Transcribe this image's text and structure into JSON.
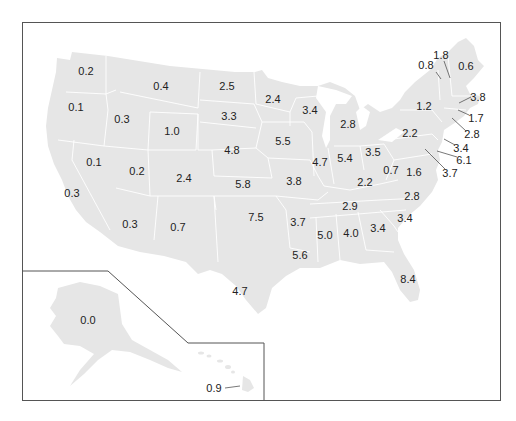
{
  "map": {
    "type": "choropleth-labeled",
    "region": "United States",
    "fill_color": "#e6e6e6",
    "border_color": "#ffffff",
    "frame_color": "#555555",
    "labels": [
      {
        "state": "WA",
        "value": "0.2",
        "x": 86,
        "y": 71
      },
      {
        "state": "OR",
        "value": "0.1",
        "x": 76,
        "y": 107
      },
      {
        "state": "ID",
        "value": "0.3",
        "x": 122,
        "y": 119
      },
      {
        "state": "MT",
        "value": "0.4",
        "x": 161,
        "y": 86
      },
      {
        "state": "WY",
        "value": "1.0",
        "x": 172,
        "y": 131
      },
      {
        "state": "ND",
        "value": "2.5",
        "x": 227,
        "y": 86
      },
      {
        "state": "SD",
        "value": "3.3",
        "x": 229,
        "y": 116
      },
      {
        "state": "NE",
        "value": "4.8",
        "x": 232,
        "y": 150
      },
      {
        "state": "KS",
        "value": "5.8",
        "x": 243,
        "y": 184
      },
      {
        "state": "MN",
        "value": "2.4",
        "x": 273,
        "y": 99
      },
      {
        "state": "IA",
        "value": "5.5",
        "x": 283,
        "y": 141
      },
      {
        "state": "MO",
        "value": "3.8",
        "x": 294,
        "y": 181
      },
      {
        "state": "WI",
        "value": "3.4",
        "x": 310,
        "y": 110
      },
      {
        "state": "IL",
        "value": "4.7",
        "x": 320,
        "y": 162
      },
      {
        "state": "MI",
        "value": "2.8",
        "x": 348,
        "y": 124
      },
      {
        "state": "IN",
        "value": "5.4",
        "x": 345,
        "y": 158
      },
      {
        "state": "OH",
        "value": "3.5",
        "x": 373,
        "y": 152
      },
      {
        "state": "NV",
        "value": "0.1",
        "x": 94,
        "y": 162
      },
      {
        "state": "UT",
        "value": "0.2",
        "x": 137,
        "y": 171
      },
      {
        "state": "CO",
        "value": "2.4",
        "x": 184,
        "y": 178
      },
      {
        "state": "CA",
        "value": "0.3",
        "x": 72,
        "y": 193
      },
      {
        "state": "AZ",
        "value": "0.3",
        "x": 130,
        "y": 224
      },
      {
        "state": "NM",
        "value": "0.7",
        "x": 178,
        "y": 227
      },
      {
        "state": "OK",
        "value": "7.5",
        "x": 256,
        "y": 217
      },
      {
        "state": "TX",
        "value": "4.7",
        "x": 240,
        "y": 291
      },
      {
        "state": "AR",
        "value": "3.7",
        "x": 298,
        "y": 222
      },
      {
        "state": "LA",
        "value": "5.6",
        "x": 300,
        "y": 255
      },
      {
        "state": "MS",
        "value": "5.0",
        "x": 325,
        "y": 235
      },
      {
        "state": "AL",
        "value": "4.0",
        "x": 351,
        "y": 233
      },
      {
        "state": "TN",
        "value": "2.9",
        "x": 350,
        "y": 206
      },
      {
        "state": "KY",
        "value": "2.2",
        "x": 365,
        "y": 182
      },
      {
        "state": "GA",
        "value": "3.4",
        "x": 378,
        "y": 228
      },
      {
        "state": "SC",
        "value": "3.4",
        "x": 405,
        "y": 218
      },
      {
        "state": "NC",
        "value": "2.8",
        "x": 412,
        "y": 196
      },
      {
        "state": "FL",
        "value": "8.4",
        "x": 408,
        "y": 279
      },
      {
        "state": "WV",
        "value": "0.7",
        "x": 391,
        "y": 170
      },
      {
        "state": "VA",
        "value": "1.6",
        "x": 414,
        "y": 172
      },
      {
        "state": "PA",
        "value": "2.2",
        "x": 410,
        "y": 133
      },
      {
        "state": "NY",
        "value": "1.2",
        "x": 424,
        "y": 106
      },
      {
        "state": "VT",
        "value": "0.8",
        "x": 426,
        "y": 65
      },
      {
        "state": "NH",
        "value": "1.8",
        "x": 441,
        "y": 55
      },
      {
        "state": "ME",
        "value": "0.6",
        "x": 466,
        "y": 66
      },
      {
        "state": "MA",
        "value": "3.8",
        "x": 478,
        "y": 97
      },
      {
        "state": "RI",
        "value": "1.7",
        "x": 476,
        "y": 118
      },
      {
        "state": "CT",
        "value": "2.8",
        "x": 472,
        "y": 134
      },
      {
        "state": "NJ",
        "value": "3.4",
        "x": 461,
        "y": 148
      },
      {
        "state": "DE",
        "value": "6.1",
        "x": 464,
        "y": 160
      },
      {
        "state": "MD",
        "value": "3.7",
        "x": 450,
        "y": 173
      },
      {
        "state": "AK",
        "value": "0.0",
        "x": 88,
        "y": 320
      },
      {
        "state": "HI",
        "value": "0.9",
        "x": 214,
        "y": 388
      }
    ],
    "leader_lines": [
      {
        "state": "VT",
        "x1": 436,
        "y1": 72,
        "x2": 441,
        "y2": 79
      },
      {
        "state": "NH",
        "x1": 444,
        "y1": 61,
        "x2": 450,
        "y2": 78
      },
      {
        "state": "MA",
        "x1": 471,
        "y1": 97,
        "x2": 459,
        "y2": 103
      },
      {
        "state": "RI",
        "x1": 469,
        "y1": 115,
        "x2": 458,
        "y2": 110
      },
      {
        "state": "CT",
        "x1": 466,
        "y1": 131,
        "x2": 452,
        "y2": 118
      },
      {
        "state": "NJ",
        "x1": 455,
        "y1": 145,
        "x2": 444,
        "y2": 139
      },
      {
        "state": "DE",
        "x1": 457,
        "y1": 157,
        "x2": 437,
        "y2": 151
      },
      {
        "state": "MD",
        "x1": 445,
        "y1": 169,
        "x2": 425,
        "y2": 149
      },
      {
        "state": "HI",
        "x1": 225,
        "y1": 388,
        "x2": 240,
        "y2": 386
      }
    ]
  }
}
